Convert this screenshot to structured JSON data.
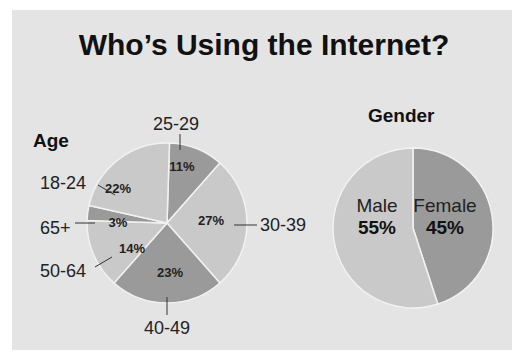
{
  "title": "Who’s Using the Internet?",
  "colors": {
    "background": "#e4e4e4",
    "light": "#c9c9c9",
    "dark": "#9a9a9a",
    "border": "#f2f2f2"
  },
  "chart_data": [
    {
      "type": "pie",
      "title": "Age",
      "categories": [
        "25-29",
        "30-39",
        "40-49",
        "50-64",
        "65+",
        "18-24"
      ],
      "values": [
        11,
        27,
        23,
        14,
        3,
        22
      ],
      "labels": [
        "11%",
        "27%",
        "23%",
        "14%",
        "3%",
        "22%"
      ],
      "shades": [
        "dark",
        "light",
        "dark",
        "light",
        "dark",
        "light"
      ]
    },
    {
      "type": "pie",
      "title": "Gender",
      "categories": [
        "Female",
        "Male"
      ],
      "values": [
        45,
        55
      ],
      "labels": [
        "45%",
        "55%"
      ],
      "shades": [
        "dark",
        "light"
      ]
    }
  ]
}
